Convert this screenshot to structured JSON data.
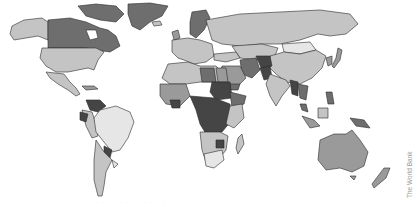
{
  "map": {
    "type": "choropleth-world-map",
    "palette": {
      "ocean": "#ffffff",
      "border": "#2a2a2a",
      "level1_lightest": "#e6e6e6",
      "level2_light": "#c4c4c4",
      "level3_mid": "#9a9a9a",
      "level4_dark": "#6e6e6e",
      "level5_darkest": "#454545"
    },
    "regions": [
      {
        "name": "Greenland",
        "shade": "level4_dark"
      },
      {
        "name": "Canada",
        "shade": "level4_dark"
      },
      {
        "name": "Alaska",
        "shade": "level2_light"
      },
      {
        "name": "United States",
        "shade": "level2_light"
      },
      {
        "name": "Mexico",
        "shade": "level2_light"
      },
      {
        "name": "Brazil",
        "shade": "level1_lightest"
      },
      {
        "name": "Argentina",
        "shade": "level2_light"
      },
      {
        "name": "Russia",
        "shade": "level2_light"
      },
      {
        "name": "China",
        "shade": "level2_light"
      },
      {
        "name": "Mongolia",
        "shade": "level1_lightest"
      },
      {
        "name": "Australia",
        "shade": "level3_mid"
      },
      {
        "name": "Central Africa",
        "shade": "level5_darkest"
      },
      {
        "name": "Southern Africa",
        "shade": "level1_lightest"
      },
      {
        "name": "Afghanistan",
        "shade": "level5_darkest"
      }
    ]
  },
  "credit": "The World Bank",
  "footnote": "· · · · · · · · · · · · · ·"
}
